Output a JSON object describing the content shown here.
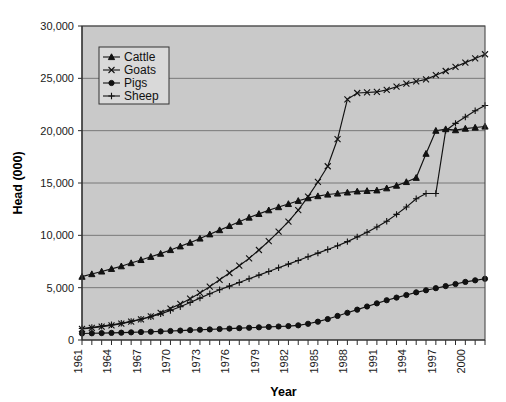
{
  "chart_data": {
    "type": "line",
    "title": "",
    "xlabel": "Year",
    "ylabel": "Head (000)",
    "xlim": [
      1961,
      2002
    ],
    "ylim": [
      0,
      30000
    ],
    "ytick_values": [
      0,
      5000,
      10000,
      15000,
      20000,
      25000,
      30000
    ],
    "ytick_labels": [
      "0",
      "5,000",
      "10,000",
      "15,000",
      "20,000",
      "25,000",
      "30,000"
    ],
    "xtick_labels": [
      "1961",
      "1964",
      "1967",
      "1970",
      "1973",
      "1976",
      "1979",
      "1982",
      "1985",
      "1988",
      "1991",
      "1994",
      "1997",
      "2000"
    ],
    "xtick_values": [
      1961,
      1964,
      1967,
      1970,
      1973,
      1976,
      1979,
      1982,
      1985,
      1988,
      1991,
      1994,
      1997,
      2000
    ],
    "x": [
      1961,
      1962,
      1963,
      1964,
      1965,
      1966,
      1967,
      1968,
      1969,
      1970,
      1971,
      1972,
      1973,
      1974,
      1975,
      1976,
      1977,
      1978,
      1979,
      1980,
      1981,
      1982,
      1983,
      1984,
      1985,
      1986,
      1987,
      1988,
      1989,
      1990,
      1991,
      1992,
      1993,
      1994,
      1995,
      1996,
      1997,
      1998,
      1999,
      2000,
      2001,
      2002
    ],
    "grid": true,
    "legend_position": "upper-left",
    "plot_background": "#c9c9c9",
    "series": [
      {
        "name": "Cattle",
        "marker": "triangle",
        "values": [
          6050,
          6300,
          6550,
          6800,
          7050,
          7350,
          7650,
          7950,
          8250,
          8600,
          8950,
          9300,
          9700,
          10100,
          10500,
          10900,
          11300,
          11700,
          12050,
          12400,
          12700,
          13000,
          13300,
          13550,
          13750,
          13900,
          14000,
          14100,
          14200,
          14250,
          14300,
          14500,
          14750,
          15100,
          15500,
          17800,
          20000,
          20150,
          20050,
          20200,
          20300,
          20400
        ]
      },
      {
        "name": "Goats",
        "marker": "x",
        "values": [
          1050,
          1150,
          1270,
          1400,
          1560,
          1750,
          1980,
          2250,
          2600,
          3000,
          3450,
          3950,
          4500,
          5100,
          5750,
          6400,
          7100,
          7800,
          8600,
          9450,
          10350,
          11300,
          12400,
          13700,
          15100,
          16600,
          19200,
          23000,
          23600,
          23650,
          23700,
          23900,
          24200,
          24500,
          24700,
          24900,
          25300,
          25700,
          26100,
          26500,
          26900,
          27300
        ]
      },
      {
        "name": "Pigs",
        "marker": "circle",
        "values": [
          620,
          640,
          660,
          680,
          700,
          730,
          760,
          790,
          820,
          860,
          900,
          940,
          980,
          1010,
          1050,
          1090,
          1130,
          1170,
          1210,
          1250,
          1290,
          1330,
          1400,
          1550,
          1750,
          2000,
          2300,
          2600,
          2900,
          3200,
          3500,
          3800,
          4050,
          4300,
          4550,
          4750,
          4950,
          5150,
          5350,
          5550,
          5700,
          5850
        ]
      },
      {
        "name": "Sheep",
        "marker": "plus",
        "values": [
          1100,
          1200,
          1320,
          1450,
          1600,
          1780,
          1980,
          2220,
          2500,
          2820,
          3180,
          3580,
          4000,
          4420,
          4800,
          5150,
          5500,
          5850,
          6200,
          6550,
          6900,
          7250,
          7600,
          7950,
          8300,
          8650,
          9000,
          9400,
          9850,
          10300,
          10800,
          11350,
          12000,
          12700,
          13500,
          14000,
          14000,
          20000,
          20700,
          21300,
          21900,
          22400
        ]
      }
    ]
  },
  "legend": {
    "items": [
      {
        "label": "Cattle",
        "marker": "triangle"
      },
      {
        "label": "Goats",
        "marker": "x"
      },
      {
        "label": "Pigs",
        "marker": "circle"
      },
      {
        "label": "Sheep",
        "marker": "plus"
      }
    ]
  },
  "axes": {
    "y_title": "Head (000)",
    "x_title": "Year"
  }
}
